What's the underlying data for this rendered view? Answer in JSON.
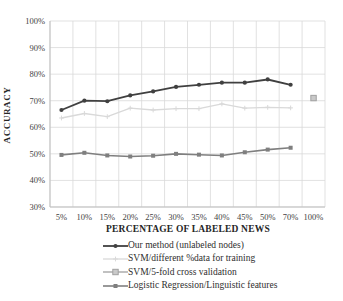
{
  "chart_data": {
    "type": "line",
    "title": "",
    "xlabel": "PERCENTAGE OF LABELED NEWS",
    "ylabel": "ACCURACY",
    "categories": [
      "5%",
      "10%",
      "15%",
      "20%",
      "25%",
      "30%",
      "35%",
      "40%",
      "45%",
      "50%",
      "70%",
      "100%"
    ],
    "y_ticks": [
      "100%",
      "90%",
      "80%",
      "70%",
      "60%",
      "50%",
      "40%",
      "30%"
    ],
    "ylim": [
      30,
      100
    ],
    "y_step": 10,
    "grid": true,
    "legend_position": "bottom",
    "series": [
      {
        "name": "Our method (unlabeled nodes)",
        "color": "#404040",
        "marker": "circle",
        "line_width": 1.8,
        "values": [
          66.5,
          70,
          69.8,
          72,
          73.5,
          75.2,
          76,
          76.8,
          76.8,
          78,
          76,
          null
        ]
      },
      {
        "name": "SVM/different %data for training",
        "color": "#d9d9d9",
        "marker": "plus",
        "line_width": 1.3,
        "values": [
          63.5,
          65.2,
          64,
          67.2,
          66.5,
          67,
          67,
          68.8,
          67.2,
          67.5,
          67.3,
          null
        ]
      },
      {
        "name": "SVM/5-fold cross validation",
        "color": "#a0a0a0",
        "marker": "square-open",
        "line_width": 1.3,
        "values": [
          null,
          null,
          null,
          null,
          null,
          null,
          null,
          null,
          null,
          null,
          null,
          71
        ]
      },
      {
        "name": "Logistic Regression/Linguistic features",
        "color": "#7f7f7f",
        "marker": "square",
        "line_width": 1.6,
        "values": [
          49.6,
          50.4,
          49.4,
          49,
          49.3,
          50,
          49.7,
          49.4,
          50.6,
          51.6,
          52.3,
          null
        ]
      }
    ],
    "colors": {
      "grid": "#d9d9d9",
      "axis": "#bfbfbf",
      "tick_text": "#3f3f3f",
      "background": "#ffffff"
    }
  }
}
